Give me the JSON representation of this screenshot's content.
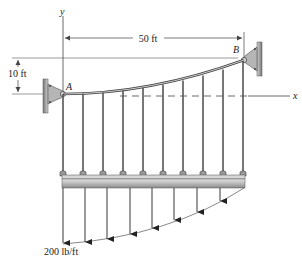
{
  "diagram": {
    "labels": {
      "y_axis": "y",
      "x_axis": "x",
      "point_a": "A",
      "point_b": "B",
      "span": "50 ft",
      "sag": "10 ft",
      "load": "200 lb/ft"
    },
    "hangers_count": 10,
    "load_arrows_count": 8,
    "colors": {
      "line": "#333333",
      "beam_top": "#d9d9d9",
      "beam_bottom": "#8f8f8f",
      "support": "#b5b5b5",
      "dim_line": "#555555"
    }
  }
}
